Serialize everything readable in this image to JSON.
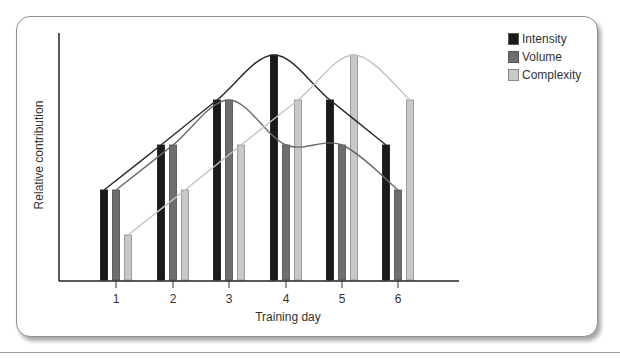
{
  "chart_data": {
    "type": "bar",
    "title": "",
    "xlabel": "Training day",
    "ylabel": "Relative contribution",
    "categories": [
      "1",
      "2",
      "3",
      "4",
      "5",
      "6"
    ],
    "series": [
      {
        "name": "Intensity",
        "color": "#1a1a1a",
        "values": [
          2,
          3,
          4,
          5,
          4,
          3
        ]
      },
      {
        "name": "Volume",
        "color": "#6e6e6e",
        "values": [
          2,
          3,
          4,
          3,
          3,
          2
        ]
      },
      {
        "name": "Complexity",
        "color": "#c8c8c8",
        "values": [
          1,
          2,
          3,
          4,
          5,
          4
        ]
      }
    ],
    "trend_curves": true,
    "ylim": [
      0,
      5.5
    ],
    "y_ticks_shown": false,
    "grid": false,
    "legend_position": "top-right"
  },
  "legend": {
    "items": [
      {
        "label": "Intensity",
        "color": "#1a1a1a"
      },
      {
        "label": "Volume",
        "color": "#6e6e6e"
      },
      {
        "label": "Complexity",
        "color": "#c8c8c8"
      }
    ]
  },
  "axes": {
    "xlabel": "Training day",
    "ylabel": "Relative contribution",
    "ticks": [
      "1",
      "2",
      "3",
      "4",
      "5",
      "6"
    ]
  }
}
